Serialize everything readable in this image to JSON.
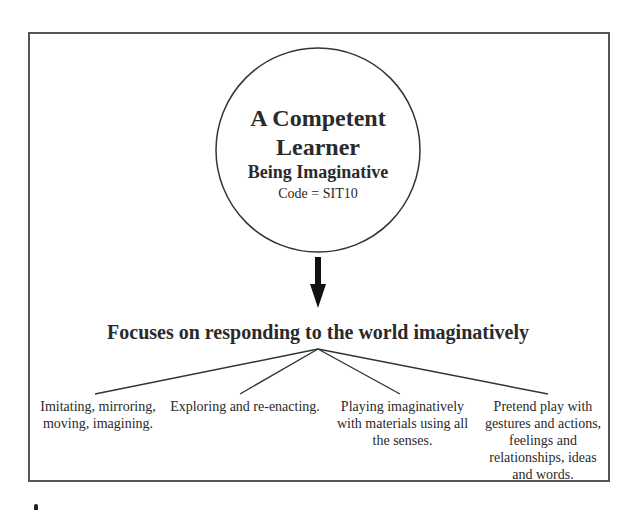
{
  "diagram": {
    "center_node": {
      "title_line1": "A Competent",
      "title_line2": "Learner",
      "subtitle": "Being Imaginative",
      "code": "Code = SIT10"
    },
    "arrow": "down-arrow",
    "focus_heading": "Focuses on responding to the world imaginatively",
    "branches": [
      {
        "label": "Imitating, mirroring, moving, imagining."
      },
      {
        "label": "Exploring and re-enacting."
      },
      {
        "label": "Playing imaginatively with materials using all the senses."
      },
      {
        "label": "Pretend play with gestures and actions, feelings and relationships, ideas and words."
      }
    ],
    "colors": {
      "line": "#333333",
      "frame": "#555555",
      "text": "#2a2a2a"
    }
  }
}
